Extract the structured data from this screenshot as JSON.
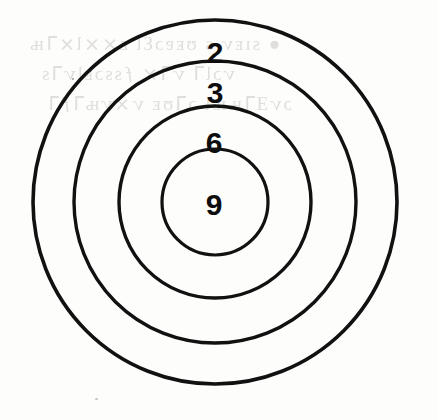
{
  "figure": {
    "background_color": "#fdfdfc",
    "stroke_color": "#111111",
    "label_color": "#0d0d0d"
  },
  "chart_data": {
    "type": "pie",
    "subtitle": "",
    "xlabel": "",
    "ylabel": "",
    "legend": "none",
    "grid": false,
    "center": {
      "x": 215,
      "y": 202
    },
    "categories": [
      "2",
      "3",
      "6",
      "9"
    ],
    "values": [
      2,
      3,
      6,
      9
    ],
    "annotations": [
      "2",
      "3",
      "6",
      "9"
    ],
    "rings": [
      {
        "label": "2",
        "value": 2,
        "radius": 182,
        "order": 1,
        "position": "outermost band"
      },
      {
        "label": "3",
        "value": 3,
        "radius": 141,
        "order": 2,
        "position": "second band"
      },
      {
        "label": "6",
        "value": 6,
        "radius": 96,
        "order": 3,
        "position": "third band"
      },
      {
        "label": "9",
        "value": 9,
        "radius": 53,
        "order": 4,
        "position": "bullseye"
      }
    ],
    "ring_count": 4,
    "stroke_width": 3.5
  },
  "labels": {
    "ring_outer": "2",
    "ring_second": "3",
    "ring_third": "6",
    "ring_center": "9"
  },
  "ghost_text": {
    "line1": "ghost-bleed-through",
    "line2": "ghost-bleed-through",
    "line3": "ghost-bleed-through"
  }
}
